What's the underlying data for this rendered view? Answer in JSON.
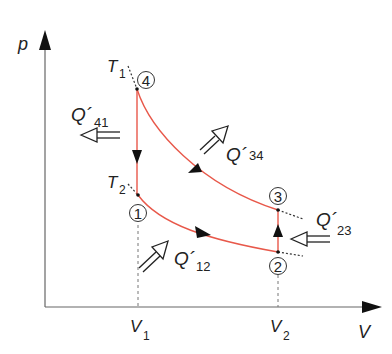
{
  "diagram": {
    "type": "pV cycle (Stirling-type)",
    "axes": {
      "y_label": "p",
      "x_label": "V",
      "x_ticks": [
        {
          "main": "V",
          "sub": "1"
        },
        {
          "main": "V",
          "sub": "2"
        }
      ]
    },
    "isotherms": [
      {
        "main": "T",
        "sub": "1"
      },
      {
        "main": "T",
        "sub": "2"
      }
    ],
    "states": [
      "1",
      "2",
      "3",
      "4"
    ],
    "heat_flows": [
      {
        "main": "Q´",
        "sub": "12"
      },
      {
        "main": "Q´",
        "sub": "23"
      },
      {
        "main": "Q´",
        "sub": "34"
      },
      {
        "main": "Q´",
        "sub": "41"
      }
    ],
    "colors": {
      "curve": "#e8584a",
      "ink": "#222222",
      "axis": "#555555"
    }
  }
}
